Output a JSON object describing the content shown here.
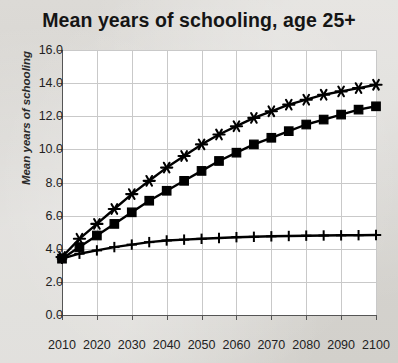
{
  "chart_data": {
    "type": "line",
    "title": "Mean years of schooling, age 25+",
    "xlabel": "",
    "ylabel": "Mean years of schooling",
    "xlim": [
      2010,
      2100
    ],
    "ylim": [
      0.0,
      16.0
    ],
    "yticks": [
      "0.0",
      "2.0",
      "4.0",
      "6.0",
      "8.0",
      "10.0",
      "12.0",
      "14.0",
      "16.0"
    ],
    "ytick_values": [
      0,
      2,
      4,
      6,
      8,
      10,
      12,
      14,
      16
    ],
    "xticks": [
      "2010",
      "2020",
      "2030",
      "2040",
      "2050",
      "2060",
      "2070",
      "2080",
      "2090",
      "2100"
    ],
    "xtick_values": [
      2010,
      2020,
      2030,
      2040,
      2050,
      2060,
      2070,
      2080,
      2090,
      2100
    ],
    "grid": true,
    "legend": "none",
    "x": [
      2010,
      2015,
      2020,
      2025,
      2030,
      2035,
      2040,
      2045,
      2050,
      2055,
      2060,
      2065,
      2070,
      2075,
      2080,
      2085,
      2090,
      2095,
      2100
    ],
    "series": [
      {
        "name": "star-series",
        "marker": "asterisk",
        "color": "#000000",
        "values": [
          3.5,
          4.6,
          5.5,
          6.4,
          7.3,
          8.1,
          8.9,
          9.6,
          10.3,
          10.9,
          11.4,
          11.9,
          12.3,
          12.7,
          13.0,
          13.3,
          13.5,
          13.7,
          13.9
        ]
      },
      {
        "name": "square-series",
        "marker": "square",
        "color": "#000000",
        "values": [
          3.4,
          4.1,
          4.8,
          5.5,
          6.2,
          6.9,
          7.5,
          8.1,
          8.7,
          9.3,
          9.8,
          10.3,
          10.7,
          11.1,
          11.5,
          11.8,
          12.1,
          12.4,
          12.6
        ]
      },
      {
        "name": "plus-series",
        "marker": "plus",
        "color": "#000000",
        "values": [
          3.4,
          3.7,
          3.9,
          4.1,
          4.25,
          4.4,
          4.5,
          4.55,
          4.6,
          4.65,
          4.7,
          4.72,
          4.75,
          4.77,
          4.79,
          4.8,
          4.81,
          4.82,
          4.83
        ]
      }
    ]
  },
  "colors": {
    "background": "#d8d6d2",
    "plot_background": "#ffffff",
    "grid": "#c9c9c9",
    "axis": "#555555",
    "ink": "#000000"
  }
}
